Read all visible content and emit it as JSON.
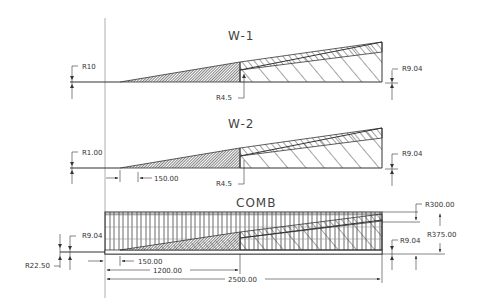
{
  "drawing": {
    "views": [
      {
        "id": "w1",
        "title": "W-1",
        "labels": {
          "left_radius": "R10",
          "mid_radius": "R4.5",
          "right_radius": "R9.04"
        }
      },
      {
        "id": "w2",
        "title": "W-2",
        "labels": {
          "left_radius": "R1.00",
          "mid_radius": "R4.5",
          "right_radius": "R9.04",
          "offset_dim": "150.00"
        }
      },
      {
        "id": "comb",
        "title": "COMB",
        "labels": {
          "top_radius": "R300.00",
          "overall_radius": "R375.00",
          "right_radius": "R9.04",
          "left_radius": "R9.04",
          "bottom_left_radius": "R22.50",
          "offset_dim": "150.00",
          "mid_length": "1200.00",
          "total_length": "2500.00"
        }
      }
    ]
  },
  "colors": {
    "line": "#333333",
    "centerline": "#999999",
    "hatch_dense": "#444444"
  }
}
